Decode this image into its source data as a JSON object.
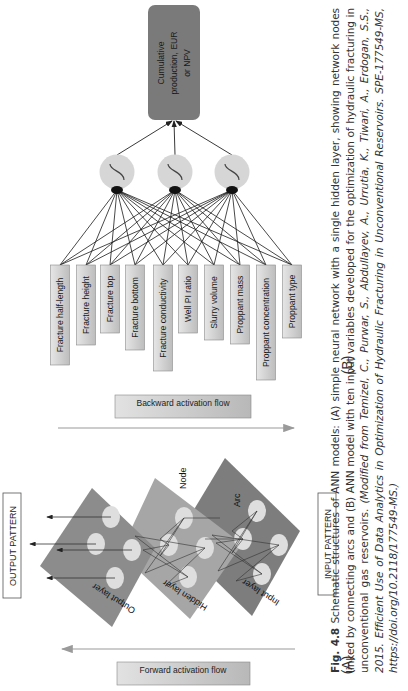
{
  "figure": {
    "orientation": "rotated-90-ccw",
    "panel_a": {
      "label": "(A)",
      "output_pattern_label": "OUTPUT PATTERN",
      "input_pattern_label": "INPUT PATTERN",
      "backward_flow_label": "Backward activation flow",
      "forward_flow_label": "Forward activation flow",
      "layers": [
        {
          "name": "Output layer",
          "node_count": 4
        },
        {
          "name": "Hidden layer",
          "node_count": 4
        },
        {
          "name": "Input layer",
          "node_count": 4
        }
      ],
      "annotations": {
        "node": "Node",
        "arc": "Arc"
      }
    },
    "panel_b": {
      "label": "(B)",
      "output_node": {
        "line1": "Cumulative",
        "line2": "production, EUR",
        "line3": "or NPV"
      },
      "hidden_node_count": 3,
      "inputs": [
        "Fracture half-length",
        "Fracture height",
        "Fracture top",
        "Fracture bottom",
        "Fracture conductivity",
        "Well PI ratio",
        "Slurry volume",
        "Proppant mass",
        "Proppant concentration",
        "Proppant type"
      ]
    },
    "caption": {
      "fig_number": "Fig. 4.8",
      "text": "Schematic structures of ANN models: (A) simple neural network with a single hidden layer, showing network nodes linked by connecting arcs and (B) ANN model with ten input variables developed for the optimization of hydraulic fracturing in unconventional gas reservoirs.",
      "source": "(Modified from Temizel, C., Purwar, S., Abdullayev, A., Urrutia, K., Tiwari, A., Erdogan, S.S., 2015. Efficient Use of Data Analytics in Optimization of Hydraulic Fracturing in Unconventional Reservoirs. SPE-177549-MS, https://doi.org/10.2118/177549-MS.)"
    },
    "colors": {
      "plane_output": "#8c8c8c",
      "plane_hidden": "#a6a6a6",
      "plane_input": "#7d7d7d",
      "node_fill": "#dedede",
      "box_fill": "#cfcfcf",
      "output_box_fill": "#7a7a7a",
      "hidden_circle_fill": "#d6d6d6"
    }
  }
}
